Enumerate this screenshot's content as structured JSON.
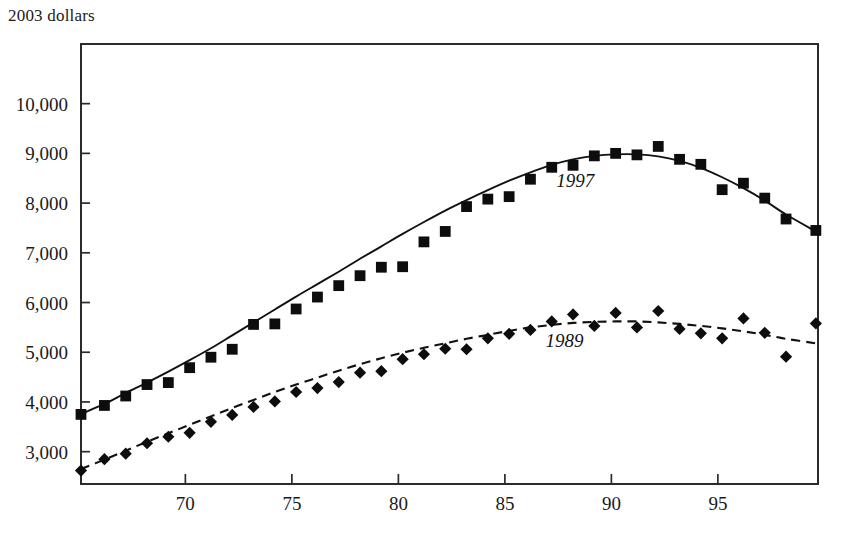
{
  "chart_data": {
    "type": "scatter",
    "title": "2003 dollars",
    "subtitle": "",
    "xlabel": "",
    "ylabel": "",
    "xlim": [
      65.1,
      99.7
    ],
    "ylim": [
      2350,
      11200
    ],
    "grid": false,
    "legend_position": "inline-annotation",
    "y_ticks": [
      3000,
      4000,
      5000,
      6000,
      7000,
      8000,
      9000,
      10000
    ],
    "y_tick_labels": [
      "3,000",
      "4,000",
      "5,000",
      "6,000",
      "7,000",
      "8,000",
      "9,000",
      "10,000"
    ],
    "x_ticks": [
      70,
      75,
      80,
      85,
      90,
      95
    ],
    "x_tick_labels": [
      "70",
      "75",
      "80",
      "85",
      "90",
      "95"
    ],
    "series": [
      {
        "name": "1997",
        "annotation": "1997",
        "annotation_x": 88.3,
        "annotation_y": 8320,
        "marker": "square",
        "line_style": "solid",
        "x": [
          65.1,
          66.2,
          67.2,
          68.2,
          69.2,
          70.2,
          71.2,
          72.2,
          73.2,
          74.2,
          75.2,
          76.2,
          77.2,
          78.2,
          79.2,
          80.2,
          81.2,
          82.2,
          83.2,
          84.2,
          85.2,
          86.2,
          87.2,
          88.2,
          89.2,
          90.2,
          91.2,
          92.2,
          93.2,
          94.2,
          95.2,
          96.2,
          97.2,
          98.2,
          99.6
        ],
        "y": [
          3750,
          3930,
          4120,
          4350,
          4390,
          4690,
          4900,
          5060,
          5560,
          5570,
          5870,
          6110,
          6340,
          6540,
          6710,
          6720,
          7220,
          7430,
          7930,
          8080,
          8130,
          8480,
          8720,
          8760,
          8950,
          9000,
          8970,
          9140,
          8880,
          8780,
          8270,
          8400,
          8100,
          7680,
          7450
        ],
        "trend_y": [
          3760,
          3960,
          4180,
          4390,
          4610,
          4840,
          5080,
          5340,
          5600,
          5860,
          6120,
          6370,
          6620,
          6880,
          7130,
          7380,
          7620,
          7850,
          8060,
          8260,
          8450,
          8620,
          8770,
          8880,
          8950,
          8980,
          8980,
          8940,
          8850,
          8710,
          8520,
          8300,
          8050,
          7770,
          7430
        ]
      },
      {
        "name": "1989",
        "annotation": "1989",
        "annotation_x": 87.8,
        "annotation_y": 5110,
        "marker": "diamond",
        "line_style": "dashed",
        "x": [
          65.1,
          66.2,
          67.2,
          68.2,
          69.2,
          70.2,
          71.2,
          72.2,
          73.2,
          74.2,
          75.2,
          76.2,
          77.2,
          78.2,
          79.2,
          80.2,
          81.2,
          82.2,
          83.2,
          84.2,
          85.2,
          86.2,
          87.2,
          88.2,
          89.2,
          90.2,
          91.2,
          92.2,
          93.2,
          94.2,
          95.2,
          96.2,
          97.2,
          98.2,
          99.6
        ],
        "y": [
          2620,
          2850,
          2960,
          3170,
          3300,
          3380,
          3600,
          3740,
          3900,
          4010,
          4200,
          4280,
          4400,
          4590,
          4620,
          4860,
          4960,
          5070,
          5060,
          5280,
          5370,
          5450,
          5620,
          5760,
          5530,
          5790,
          5500,
          5830,
          5470,
          5380,
          5280,
          5680,
          5390,
          4910,
          5580
        ],
        "trend_y": [
          2650,
          2840,
          3020,
          3200,
          3370,
          3540,
          3710,
          3880,
          4040,
          4200,
          4350,
          4490,
          4630,
          4760,
          4880,
          4990,
          5090,
          5180,
          5270,
          5350,
          5430,
          5500,
          5550,
          5590,
          5610,
          5620,
          5620,
          5600,
          5570,
          5530,
          5480,
          5420,
          5350,
          5270,
          5180
        ]
      }
    ]
  }
}
